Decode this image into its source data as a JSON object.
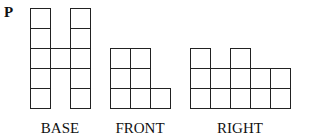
{
  "problem_label": "P",
  "cell_size": 20,
  "line_color": "#222222",
  "views": [
    {
      "name": "BASE",
      "origin": [
        30,
        8
      ],
      "cells": [
        [
          0,
          0
        ],
        [
          0,
          1
        ],
        [
          0,
          2
        ],
        [
          0,
          3
        ],
        [
          0,
          4
        ],
        [
          1,
          2
        ],
        [
          2,
          0
        ],
        [
          2,
          1
        ],
        [
          2,
          2
        ],
        [
          2,
          3
        ],
        [
          2,
          4
        ]
      ],
      "label_x": 60
    },
    {
      "name": "FRONT",
      "origin": [
        110,
        48
      ],
      "column_heights": [
        3,
        3,
        1
      ],
      "rows": 3,
      "label_x": 140
    },
    {
      "name": "RIGHT",
      "origin": [
        190,
        48
      ],
      "column_heights": [
        3,
        2,
        3,
        2,
        2
      ],
      "rows": 3,
      "label_x": 240
    }
  ],
  "label_y": 120
}
